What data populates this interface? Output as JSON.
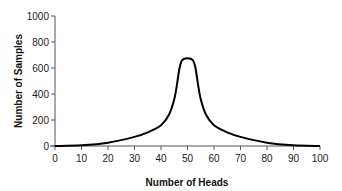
{
  "chart_data": {
    "type": "line",
    "title": "",
    "xlabel": "Number of Heads",
    "ylabel": "Number of Samples",
    "xlim": [
      0,
      100
    ],
    "ylim": [
      0,
      1000
    ],
    "x_ticks": [
      0,
      10,
      20,
      30,
      40,
      50,
      60,
      70,
      80,
      90,
      100
    ],
    "y_ticks": [
      0,
      200,
      400,
      600,
      800,
      1000
    ],
    "grid": false,
    "legend": null,
    "series": [
      {
        "name": "samples",
        "color": "#000000",
        "x": [
          0,
          10,
          20,
          30,
          35,
          40,
          43,
          45,
          46,
          47,
          48,
          50,
          52,
          53,
          54,
          55,
          57,
          60,
          65,
          70,
          80,
          90,
          100
        ],
        "values": [
          0,
          5,
          25,
          70,
          105,
          160,
          240,
          360,
          470,
          600,
          660,
          675,
          660,
          600,
          470,
          360,
          240,
          160,
          105,
          70,
          25,
          5,
          0
        ]
      }
    ]
  }
}
